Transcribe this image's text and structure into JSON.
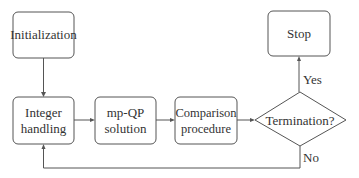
{
  "diagram": {
    "type": "flowchart",
    "nodes": {
      "initialization": {
        "label": "Initialization"
      },
      "integer_handling": {
        "line1": "Integer",
        "line2": "handling"
      },
      "mpqp_solution": {
        "line1": "mp-QP",
        "line2": "solution"
      },
      "comparison_procedure": {
        "line1": "Comparison",
        "line2": "procedure"
      },
      "termination": {
        "label": "Termination?"
      },
      "stop": {
        "label": "Stop"
      }
    },
    "edge_labels": {
      "yes": "Yes",
      "no": "No"
    },
    "edges": [
      {
        "from": "Initialization",
        "to": "Integer handling"
      },
      {
        "from": "Integer handling",
        "to": "mp-QP solution"
      },
      {
        "from": "mp-QP solution",
        "to": "Comparison procedure"
      },
      {
        "from": "Comparison procedure",
        "to": "Termination?"
      },
      {
        "from": "Termination?",
        "to": "Stop",
        "label": "Yes"
      },
      {
        "from": "Termination?",
        "to": "Integer handling",
        "label": "No"
      }
    ],
    "colors": {
      "stroke": "#555555",
      "text": "#333333",
      "background": "#ffffff"
    }
  }
}
